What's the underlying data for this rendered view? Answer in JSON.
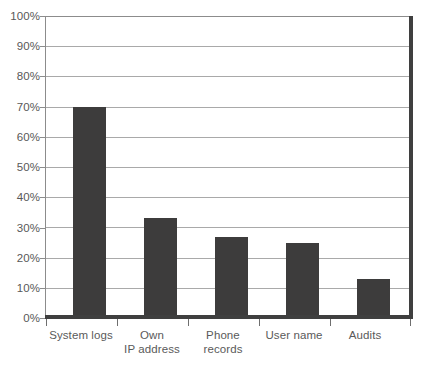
{
  "chart_data": {
    "type": "bar",
    "title": "",
    "subtitle": "",
    "xlabel": "",
    "ylabel": "",
    "categories": [
      "System logs",
      "Own\nIP address",
      "Phone\nrecords",
      "User name",
      "Audits"
    ],
    "category_lines": [
      [
        "System logs"
      ],
      [
        "Own",
        "IP address"
      ],
      [
        "Phone",
        "records"
      ],
      [
        "User name"
      ],
      [
        "Audits"
      ]
    ],
    "values": [
      70,
      33,
      27,
      25,
      13
    ],
    "value_labels": [
      "70%",
      "33%",
      "27%",
      "25%",
      "13%"
    ],
    "ylim": [
      0,
      100
    ],
    "ytick_values": [
      100,
      90,
      80,
      70,
      60,
      50,
      40,
      30,
      20,
      10,
      0
    ],
    "ytick_labels": [
      "100%",
      "90%",
      "80%",
      "70%",
      "60%",
      "50%",
      "40%",
      "30%",
      "20%",
      "10%",
      "0%"
    ],
    "grid": true,
    "grid_axis": "y",
    "legend": false,
    "legend_position": "none",
    "bar_color": "#3d3c3c",
    "grid_color": "#a9a9a9",
    "axis_color": "#3f3f3f",
    "background_color": "#ffffff",
    "text_color": "#585858"
  }
}
